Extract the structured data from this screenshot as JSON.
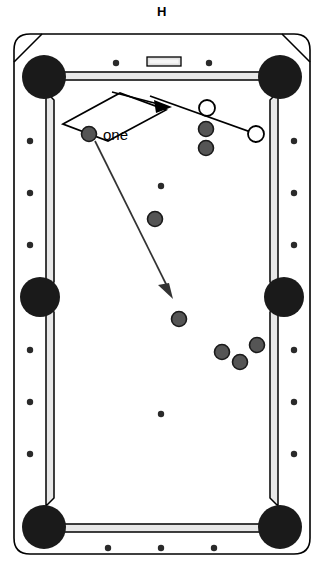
{
  "title": "H",
  "diagram": {
    "type": "pool-table-shot-diagram",
    "table": {
      "frame_color": "#ffffff",
      "frame_outline": "#000000",
      "cushion_color": "#e8e8e8",
      "pocket_color": "#1a1a1a",
      "bed_color": "#ffffff",
      "nameplate_color": "#e0e0e0"
    },
    "pockets": [
      {
        "name": "top-left-corner-pocket",
        "cx": 44,
        "cy": 77,
        "r": 22
      },
      {
        "name": "top-right-corner-pocket",
        "cx": 280,
        "cy": 77,
        "r": 22
      },
      {
        "name": "left-side-pocket",
        "cx": 40,
        "cy": 297,
        "r": 20
      },
      {
        "name": "right-side-pocket",
        "cx": 284,
        "cy": 297,
        "r": 20
      },
      {
        "name": "bottom-left-corner-pocket",
        "cx": 44,
        "cy": 527,
        "r": 22
      },
      {
        "name": "bottom-right-corner-pocket",
        "cx": 280,
        "cy": 527,
        "r": 22
      }
    ],
    "rail_diamonds": [
      {
        "cx": 116,
        "cy": 63
      },
      {
        "cx": 209,
        "cy": 63
      },
      {
        "cx": 30,
        "cy": 141
      },
      {
        "cx": 30,
        "cy": 193
      },
      {
        "cx": 30,
        "cy": 245
      },
      {
        "cx": 30,
        "cy": 350
      },
      {
        "cx": 30,
        "cy": 402
      },
      {
        "cx": 30,
        "cy": 454
      },
      {
        "cx": 294,
        "cy": 141
      },
      {
        "cx": 294,
        "cy": 193
      },
      {
        "cx": 294,
        "cy": 245
      },
      {
        "cx": 294,
        "cy": 350
      },
      {
        "cx": 294,
        "cy": 402
      },
      {
        "cx": 294,
        "cy": 454
      },
      {
        "cx": 108,
        "cy": 548
      },
      {
        "cx": 161,
        "cy": 548
      },
      {
        "cx": 214,
        "cy": 548
      }
    ],
    "bed_spots": [
      {
        "cx": 161,
        "cy": 186
      },
      {
        "cx": 161,
        "cy": 414
      }
    ],
    "balls": [
      {
        "id": "ball-one",
        "label": "one",
        "cx": 89,
        "cy": 134,
        "r": 7.5,
        "fill": "#555555",
        "kind": "object-ball"
      },
      {
        "id": "ball-object-upper",
        "cx": 206,
        "cy": 129,
        "r": 7.5,
        "fill": "#555555",
        "kind": "object-ball"
      },
      {
        "id": "ball-object-lower",
        "cx": 206,
        "cy": 148,
        "r": 7.5,
        "fill": "#555555",
        "kind": "object-ball"
      },
      {
        "id": "ball-mid",
        "cx": 155,
        "cy": 219,
        "r": 7.5,
        "fill": "#555555",
        "kind": "object-ball"
      },
      {
        "id": "ball-center-low",
        "cx": 179,
        "cy": 319,
        "r": 7.5,
        "fill": "#555555",
        "kind": "object-ball"
      },
      {
        "id": "ball-cluster-left",
        "cx": 222,
        "cy": 352,
        "r": 7.5,
        "fill": "#555555",
        "kind": "object-ball"
      },
      {
        "id": "ball-cluster-mid",
        "cx": 240,
        "cy": 362,
        "r": 7.5,
        "fill": "#555555",
        "kind": "object-ball"
      },
      {
        "id": "ball-cluster-right",
        "cx": 257,
        "cy": 345,
        "r": 7.5,
        "fill": "#555555",
        "kind": "object-ball"
      }
    ],
    "ghost_balls": [
      {
        "id": "ghost-ball-contact",
        "cx": 207,
        "cy": 108,
        "r": 8,
        "fill": "#ffffff",
        "stroke": "#000000"
      },
      {
        "id": "ghost-ball-cue",
        "cx": 256,
        "cy": 134,
        "r": 8,
        "fill": "#ffffff",
        "stroke": "#000000"
      }
    ],
    "ghost_ball_line": {
      "x1": 207,
      "y1": 108,
      "x2": 256,
      "y2": 134
    },
    "aim_band": {
      "name": "cue-aim-band",
      "points": "63,124 120,93 166,110 108,141"
    },
    "cue_tangent_line": {
      "x1": 112,
      "y1": 92,
      "x2": 172,
      "y2": 112
    },
    "arrows": [
      {
        "id": "arrow-upper",
        "x1": 112,
        "y1": 92,
        "x2": 168,
        "y2": 107,
        "angle_deg": 15
      },
      {
        "id": "arrow-lower",
        "x1": 95,
        "y1": 141,
        "x2": 172,
        "y2": 296,
        "angle_deg": 63
      }
    ],
    "nameplate": {
      "x": 147,
      "y": 57,
      "w": 34,
      "h": 9
    }
  }
}
